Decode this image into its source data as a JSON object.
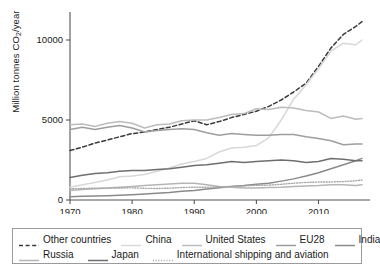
{
  "chart_data": {
    "type": "line",
    "title": "",
    "xlabel": "",
    "ylabel": "Million tonnes CO2/year",
    "ylabel_parts": {
      "pre": "Million tonnes CO",
      "sub": "2",
      "post": "/year"
    },
    "xlim": [
      1970,
      2017
    ],
    "ylim": [
      0,
      11500
    ],
    "xticks": [
      1970,
      1980,
      1990,
      2000,
      2010
    ],
    "yticks": [
      0,
      5000,
      10000
    ],
    "grid": false,
    "legend_position": "below",
    "x": [
      1970,
      1972,
      1974,
      1976,
      1978,
      1980,
      1982,
      1984,
      1986,
      1988,
      1990,
      1992,
      1994,
      1996,
      1998,
      2000,
      2002,
      2004,
      2006,
      2008,
      2010,
      2012,
      2014,
      2016,
      2017
    ],
    "series": [
      {
        "name": "Other countries",
        "color": "#3a3a3a",
        "style": "dashed",
        "width": 1.5,
        "values": [
          3100,
          3300,
          3550,
          3750,
          3950,
          4150,
          4250,
          4400,
          4550,
          4750,
          4950,
          4700,
          4900,
          5150,
          5350,
          5550,
          5850,
          6250,
          6750,
          7300,
          8350,
          9500,
          10350,
          10850,
          11150
        ]
      },
      {
        "name": "China",
        "color": "#d8d8d8",
        "style": "solid",
        "width": 1.5,
        "values": [
          800,
          950,
          1100,
          1250,
          1450,
          1500,
          1600,
          1800,
          2000,
          2250,
          2400,
          2600,
          3000,
          3250,
          3300,
          3400,
          3900,
          5000,
          6300,
          7200,
          8200,
          9300,
          9800,
          9700,
          10000
        ]
      },
      {
        "name": "United States",
        "color": "#bcbcbc",
        "style": "solid",
        "width": 1.5,
        "values": [
          4700,
          4750,
          4600,
          4800,
          4900,
          4800,
          4500,
          4700,
          4750,
          4950,
          5000,
          5000,
          5150,
          5350,
          5400,
          5700,
          5650,
          5800,
          5750,
          5600,
          5500,
          5100,
          5250,
          5050,
          5100
        ]
      },
      {
        "name": "EU28",
        "color": "#9e9e9e",
        "style": "solid",
        "width": 1.5,
        "values": [
          4400,
          4550,
          4400,
          4550,
          4650,
          4500,
          4250,
          4350,
          4400,
          4450,
          4400,
          4200,
          4050,
          4150,
          4100,
          4050,
          4050,
          4100,
          4100,
          3950,
          3850,
          3700,
          3450,
          3500,
          3500
        ]
      },
      {
        "name": "India",
        "color": "#8a8a8a",
        "style": "solid",
        "width": 1.5,
        "values": [
          200,
          230,
          250,
          270,
          300,
          330,
          370,
          420,
          470,
          540,
          600,
          680,
          760,
          850,
          900,
          980,
          1050,
          1180,
          1320,
          1500,
          1700,
          1950,
          2200,
          2450,
          2600
        ]
      },
      {
        "name": "Russia",
        "color": "#b5b5b5",
        "style": "solid",
        "width": 1.5,
        "values": [
          600,
          650,
          700,
          750,
          800,
          850,
          900,
          950,
          1000,
          1050,
          1050,
          950,
          850,
          800,
          750,
          750,
          780,
          800,
          850,
          870,
          900,
          950,
          950,
          900,
          950
        ]
      },
      {
        "name": "Japan",
        "color": "#6e6e6e",
        "style": "solid",
        "width": 1.5,
        "values": [
          1400,
          1550,
          1650,
          1700,
          1800,
          1850,
          1850,
          1900,
          1950,
          2050,
          2150,
          2200,
          2300,
          2400,
          2350,
          2400,
          2450,
          2500,
          2450,
          2350,
          2400,
          2600,
          2550,
          2450,
          2450
        ]
      },
      {
        "name": "International shipping and aviation",
        "color": "#a5a5a5",
        "style": "dotted",
        "width": 1.4,
        "values": [
          700,
          720,
          740,
          740,
          750,
          760,
          730,
          720,
          740,
          780,
          800,
          800,
          820,
          850,
          880,
          920,
          930,
          980,
          1050,
          1100,
          1120,
          1130,
          1150,
          1200,
          1250
        ]
      }
    ]
  },
  "legend": {
    "rows": [
      [
        {
          "label": "Other countries",
          "series": "Other countries"
        },
        {
          "label": "China",
          "series": "China"
        },
        {
          "label": "United States",
          "series": "United States"
        },
        {
          "label": "EU28",
          "series": "EU28"
        },
        {
          "label": "India",
          "series": "India"
        }
      ],
      [
        {
          "label": "Russia",
          "series": "Russia"
        },
        {
          "label": "Japan",
          "series": "Japan"
        },
        {
          "label": "International shipping and aviation",
          "series": "International shipping and aviation"
        }
      ]
    ]
  }
}
